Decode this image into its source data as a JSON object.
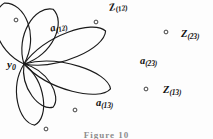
{
  "figure": {
    "caption": "Figure 10",
    "vertex": {
      "name": "base-point",
      "base": "y",
      "sub": "0",
      "x": 24,
      "y": 64
    },
    "stroke_color": "#1a1a1a",
    "background_color": "#fdfdfd",
    "petals": [
      {
        "id": "petal-upper-left",
        "angle_deg": -108,
        "length": 64,
        "width": 19,
        "dot": {
          "x": 16,
          "y": 20
        }
      },
      {
        "id": "petal-upper-right",
        "angle_deg": -62,
        "length": 62,
        "width": 17,
        "dot": {
          "x": 96,
          "y": 22
        }
      },
      {
        "id": "petal-right-upper",
        "angle_deg": -22,
        "length": 88,
        "width": 15,
        "dot": {
          "x": 166,
          "y": 32
        }
      },
      {
        "id": "petal-right-lower",
        "angle_deg": 16,
        "length": 90,
        "width": 15,
        "dot": {
          "x": 146,
          "y": 89
        }
      },
      {
        "id": "petal-lower-left-inner",
        "angle_deg": 56,
        "length": 52,
        "width": 13,
        "dot": {
          "x": 75,
          "y": 110
        }
      },
      {
        "id": "petal-lower-left-outer",
        "angle_deg": 80,
        "length": 62,
        "width": 15,
        "dot": {
          "x": 46,
          "y": 129
        }
      }
    ],
    "labels": [
      {
        "id": "label-a-12",
        "name": "label-a-12",
        "base": "a",
        "sub": "(12)",
        "x": 49,
        "y": 24,
        "rotate": -14
      },
      {
        "id": "label-z-12",
        "name": "label-z-12",
        "base": "Z",
        "sub": "(12)",
        "x": 108,
        "y": 3,
        "rotate": -10
      },
      {
        "id": "label-z-23",
        "name": "label-z-23",
        "base": "Z",
        "sub": "(23)",
        "x": 181,
        "y": 29,
        "rotate": 0
      },
      {
        "id": "label-a-23",
        "name": "label-a-23",
        "base": "a",
        "sub": "(23)",
        "x": 140,
        "y": 56,
        "rotate": 0
      },
      {
        "id": "label-z-13",
        "name": "label-z-13",
        "base": "Z",
        "sub": "(13)",
        "x": 163,
        "y": 85,
        "rotate": 0
      },
      {
        "id": "label-a-13",
        "name": "label-a-13",
        "base": "a",
        "sub": "(13)",
        "x": 96,
        "y": 98,
        "rotate": 0
      }
    ]
  }
}
